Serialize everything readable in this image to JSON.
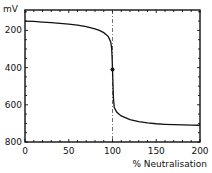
{
  "chart_data": {
    "type": "line",
    "title": "",
    "xlabel": "% Neutralisation",
    "ylabel": "mV",
    "xlim": [
      0,
      200
    ],
    "ylim": [
      800,
      100
    ],
    "y_inverted": true,
    "grid": false,
    "legend": null,
    "x_ticks": [
      0,
      50,
      100,
      150,
      200
    ],
    "y_ticks": [
      200,
      400,
      600,
      800
    ],
    "x_tick_labels": [
      "0",
      "50",
      "100",
      "150",
      "200"
    ],
    "y_tick_labels": [
      "200",
      "400",
      "600",
      "800"
    ],
    "series": [
      {
        "name": "titration curve",
        "x": [
          0,
          10,
          20,
          30,
          40,
          50,
          60,
          70,
          80,
          85,
          90,
          95,
          98,
          99,
          99.5,
          100,
          100.5,
          101,
          102,
          105,
          110,
          120,
          130,
          140,
          150,
          160,
          170,
          180,
          190,
          200
        ],
        "y": [
          150,
          152,
          155,
          158,
          162,
          166,
          172,
          180,
          192,
          200,
          212,
          232,
          262,
          295,
          340,
          410,
          480,
          560,
          615,
          640,
          660,
          680,
          690,
          697,
          702,
          705,
          707,
          708,
          709,
          710
        ]
      }
    ],
    "annotations": [
      {
        "type": "vline",
        "x": 100,
        "style": "dash-dot",
        "label": "equivalence point"
      },
      {
        "type": "point",
        "x": 100,
        "y": 410,
        "label": "equivalence marker"
      }
    ]
  }
}
